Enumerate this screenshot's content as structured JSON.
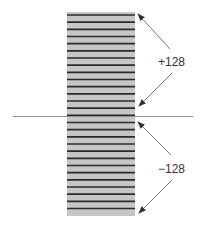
{
  "diagram": {
    "labels": {
      "upper": "+128",
      "lower": "−128"
    },
    "block": {
      "stripe_count": 28,
      "fill_color": "#c6c6c6",
      "line_color": "#2b2b2b"
    },
    "axis_color": "#8f8f8f",
    "arrow_color": "#555555"
  }
}
